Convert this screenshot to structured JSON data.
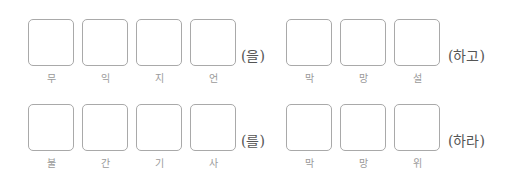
{
  "rows": [
    {
      "group1": {
        "hints": [
          "무",
          "익",
          "지",
          "언"
        ],
        "suffix": "(을)"
      },
      "group2": {
        "hints": [
          "막",
          "망",
          "설"
        ],
        "suffix": "(하고)"
      }
    },
    {
      "group1": {
        "hints": [
          "불",
          "간",
          "기",
          "사"
        ],
        "suffix": "(를)"
      },
      "group2": {
        "hints": [
          "막",
          "망",
          "위"
        ],
        "suffix": "(하라)"
      }
    }
  ]
}
